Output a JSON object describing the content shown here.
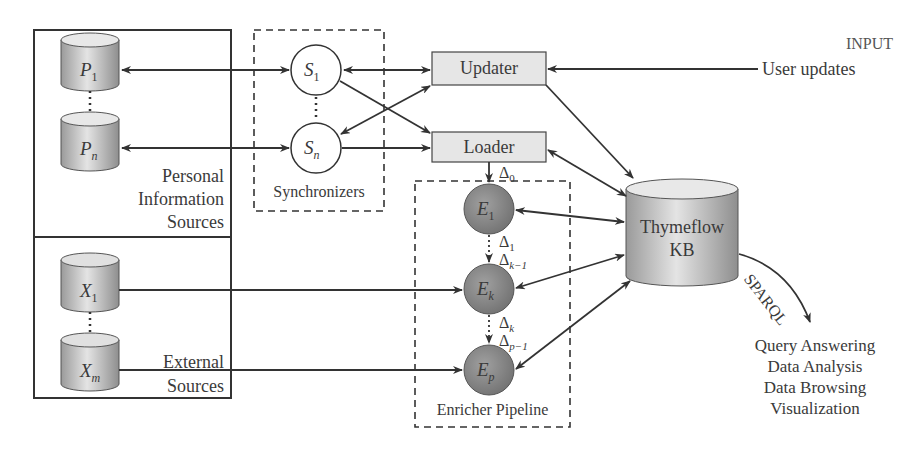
{
  "groups": {
    "personal": {
      "label_lines": [
        "Personal",
        "Information",
        "Sources"
      ]
    },
    "external": {
      "label_lines": [
        "External",
        "Sources"
      ]
    },
    "synchronizers": {
      "label": "Synchronizers"
    },
    "enricher": {
      "label": "Enricher Pipeline"
    }
  },
  "sources": {
    "personal": [
      {
        "base": "P",
        "sub": "1"
      },
      {
        "base": "P",
        "sub": "n"
      }
    ],
    "external": [
      {
        "base": "X",
        "sub": "1"
      },
      {
        "base": "X",
        "sub": "m"
      }
    ]
  },
  "synchronizer_nodes": [
    {
      "base": "S",
      "sub": "1"
    },
    {
      "base": "S",
      "sub": "n"
    }
  ],
  "components": {
    "updater": "Updater",
    "loader": "Loader",
    "kb_lines": [
      "Thymeflow",
      "KB"
    ]
  },
  "enrichers": [
    {
      "base": "E",
      "sub": "1"
    },
    {
      "base": "E",
      "sub": "k"
    },
    {
      "base": "E",
      "sub": "p"
    }
  ],
  "deltas": {
    "d0": {
      "base": "Δ",
      "sub": "0"
    },
    "d1": {
      "base": "Δ",
      "sub": "1"
    },
    "dk1": {
      "base": "Δ",
      "sub": "k−1"
    },
    "dk": {
      "base": "Δ",
      "sub": "k"
    },
    "dp1": {
      "base": "Δ",
      "sub": "p−1"
    }
  },
  "input": {
    "title": "INPUT",
    "label": "User updates"
  },
  "sparql": {
    "label": "SPARQL"
  },
  "outputs": [
    "Query Answering",
    "Data Analysis",
    "Data Browsing",
    "Visualization"
  ],
  "colors": {
    "line": "#3a3a3a",
    "box_fill": "#e6e6e6",
    "enricher_fill": "#8a8a8a",
    "cylinder_light": "#eeeeee",
    "cylinder_dark": "#9a9a9a"
  }
}
